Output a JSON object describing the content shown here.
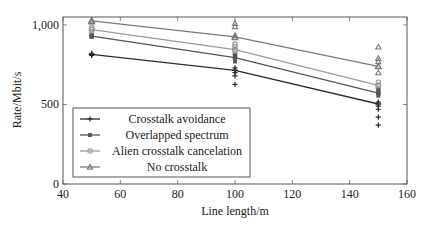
{
  "chart_data": {
    "type": "line",
    "title": "",
    "xlabel": "Line length/m",
    "ylabel": "Rate/Mbit/s",
    "xlim": [
      40,
      160
    ],
    "ylim": [
      0,
      1050
    ],
    "x_ticks": [
      40,
      60,
      80,
      100,
      120,
      140,
      160
    ],
    "x_tick_labels": [
      "40",
      "60",
      "80",
      "100",
      "120",
      "140",
      "160"
    ],
    "y_ticks": [
      0,
      500,
      1000
    ],
    "y_tick_labels": [
      "0",
      "500",
      "1,000"
    ],
    "grid": false,
    "legend_position": "lower left",
    "x": [
      50,
      100,
      150
    ],
    "series": [
      {
        "name": "Crosstalk avoidance",
        "marker": "plus",
        "color": "#2b2b2b",
        "values": [
          815,
          715,
          503
        ],
        "scatter": [
          {
            "x": 50,
            "y": [
              808,
              815,
              822
            ]
          },
          {
            "x": 100,
            "y": [
              627,
              680,
              700,
              715,
              730
            ]
          },
          {
            "x": 150,
            "y": [
              370,
              420,
              470,
              490,
              503,
              515
            ]
          }
        ]
      },
      {
        "name": "Overlapped spectrum",
        "marker": "square",
        "color": "#555555",
        "values": [
          930,
          795,
          572
        ],
        "scatter": [
          {
            "x": 50,
            "y": [
              925,
              935
            ]
          },
          {
            "x": 100,
            "y": [
              770,
              795,
              810
            ]
          },
          {
            "x": 150,
            "y": [
              555,
              572,
              590
            ]
          }
        ]
      },
      {
        "name": "Alien crosstalk cancelation",
        "marker": "circle",
        "color": "#9a9a9a",
        "values": [
          970,
          845,
          620
        ],
        "scatter": [
          {
            "x": 50,
            "y": [
              955,
              970,
              985
            ]
          },
          {
            "x": 100,
            "y": [
              820,
              845,
              865,
              880
            ]
          },
          {
            "x": 150,
            "y": [
              600,
              620,
              640
            ]
          }
        ]
      },
      {
        "name": "No crosstalk",
        "marker": "triangle",
        "color": "#7a7a7a",
        "values": [
          1025,
          925,
          740
        ],
        "scatter": [
          {
            "x": 50,
            "y": [
              1020,
              1030
            ]
          },
          {
            "x": 100,
            "y": [
              920,
              935,
              990,
              1010
            ]
          },
          {
            "x": 150,
            "y": [
              700,
              740,
              770,
              790,
              862
            ]
          }
        ]
      }
    ]
  }
}
